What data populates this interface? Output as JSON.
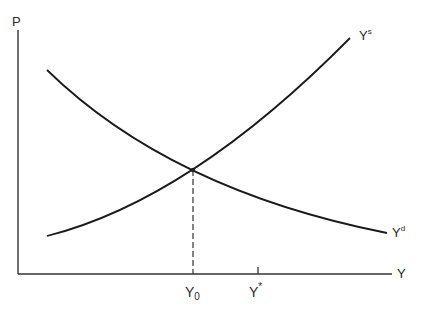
{
  "diagram": {
    "type": "supply-demand",
    "axes": {
      "y_label": "P",
      "x_label": "Y"
    },
    "curves": [
      {
        "id": "supply",
        "label_base": "Y",
        "label_sup": "s"
      },
      {
        "id": "demand",
        "label_base": "Y",
        "label_sup": "d"
      }
    ],
    "x_ticks": [
      {
        "label_base": "Y",
        "label_sub": "0"
      },
      {
        "label_base": "Y",
        "label_sup": "*"
      }
    ],
    "colors": {
      "line": "#1a1a1a",
      "text": "#2a2a2a",
      "background": "#ffffff"
    }
  }
}
